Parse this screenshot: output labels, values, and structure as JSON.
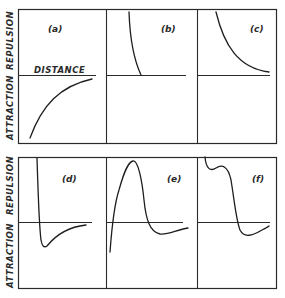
{
  "figure": {
    "y_axis_labels": {
      "upper": "REPULSION",
      "lower": "ATTRACTION"
    },
    "x_axis_label": "DISTANCE",
    "panels": [
      {
        "id": "a",
        "label": "(a)",
        "description": "Pure attraction rising toward zero with distance"
      },
      {
        "id": "b",
        "label": "(b)",
        "description": "Steep short-range repulsion"
      },
      {
        "id": "c",
        "label": "(c)",
        "description": "Long-range repulsion decaying with distance"
      },
      {
        "id": "d",
        "label": "(d)",
        "description": "Short-range repulsion with attractive well"
      },
      {
        "id": "e",
        "label": "(e)",
        "description": "Attraction at short range, repulsive barrier, then shallow attractive well"
      },
      {
        "id": "f",
        "label": "(f)",
        "description": "Repulsion with shoulder, then shallow attractive well"
      }
    ],
    "colors": {
      "line": "#1e1e1e",
      "background": "#ffffff"
    }
  }
}
